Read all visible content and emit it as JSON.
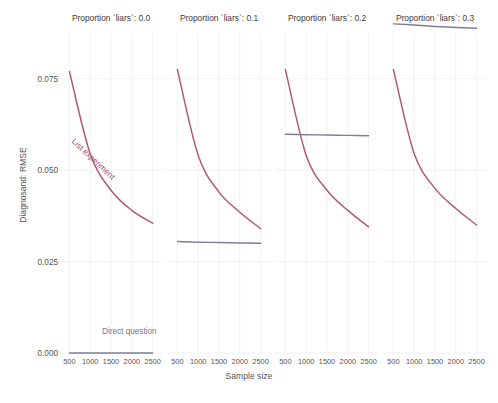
{
  "chart_data": {
    "type": "line",
    "title": "",
    "xlabel": "Sample size",
    "ylabel": "Diagnosand: RMSE",
    "xlim": [
      250,
      2750
    ],
    "ylim": [
      0.0,
      0.0875
    ],
    "grid": true,
    "legend_position": "inline-annotation",
    "x_ticks": [
      500,
      1000,
      1500,
      2000,
      2500
    ],
    "y_ticks": [
      0.0,
      0.025,
      0.05,
      0.075
    ],
    "y_tick_labels": [
      "0.000",
      "0.025",
      "0.050",
      "0.075"
    ],
    "facet_variable": "Proportion `liars`",
    "facets": [
      {
        "label": "Proportion `liars`: 0.0",
        "proportion_liars": 0.0,
        "x": [
          500,
          1000,
          1500,
          2000,
          2500
        ],
        "series": [
          {
            "name": "List experiment",
            "color": "#b0576f",
            "values": [
              0.077,
              0.0545,
              0.0445,
              0.039,
              0.0355
            ]
          },
          {
            "name": "Direct question",
            "color": "#7a8099",
            "values": [
              0.0,
              0.0,
              0.0,
              0.0,
              0.0
            ]
          }
        ]
      },
      {
        "label": "Proportion `liars`: 0.1",
        "proportion_liars": 0.1,
        "x": [
          500,
          1000,
          1500,
          2000,
          2500
        ],
        "series": [
          {
            "name": "List experiment",
            "color": "#b0576f",
            "values": [
              0.0775,
              0.054,
              0.044,
              0.0385,
              0.034
            ]
          },
          {
            "name": "Direct question",
            "color": "#7a8099",
            "values": [
              0.0305,
              0.0303,
              0.0302,
              0.0301,
              0.03
            ]
          }
        ]
      },
      {
        "label": "Proportion `liars`: 0.2",
        "proportion_liars": 0.2,
        "x": [
          500,
          1000,
          1500,
          2000,
          2500
        ],
        "series": [
          {
            "name": "List experiment",
            "color": "#b0576f",
            "values": [
              0.0775,
              0.054,
              0.0445,
              0.039,
              0.0345
            ]
          },
          {
            "name": "Direct question",
            "color": "#7a8099",
            "values": [
              0.0598,
              0.0597,
              0.0596,
              0.0595,
              0.0594
            ]
          }
        ]
      },
      {
        "label": "Proportion `liars`: 0.3",
        "proportion_liars": 0.3,
        "x": [
          500,
          1000,
          1500,
          2000,
          2500
        ],
        "series": [
          {
            "name": "List experiment",
            "color": "#b0576f",
            "values": [
              0.0775,
              0.0545,
              0.045,
              0.0395,
              0.035
            ]
          },
          {
            "name": "Direct question",
            "color": "#7a8099",
            "values": [
              0.09,
              0.0897,
              0.0893,
              0.089,
              0.0888
            ]
          }
        ]
      }
    ],
    "annotations": [
      {
        "text": "List experiment",
        "series": "List experiment",
        "color": "#9e5068",
        "facet": 0
      },
      {
        "text": "Direct question",
        "series": "Direct question",
        "color": "#6f7694",
        "facet": 0
      }
    ],
    "colors": {
      "list_experiment": "#b0576f",
      "direct_question": "#7a8099",
      "grid": "#f0eef0",
      "text": "#555555",
      "background": "#ffffff"
    }
  },
  "caption": {
    "text": ""
  }
}
